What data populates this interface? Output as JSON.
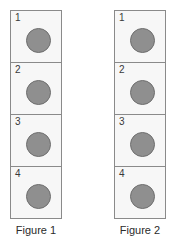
{
  "canvas": {
    "width": 171,
    "height": 242,
    "background": "#ffffff"
  },
  "style": {
    "box_fill": "#f7f7f7",
    "box_border": "#8a8a8a",
    "disc_fill": "#8f8f8f",
    "disc_outline": "#6e6e6e",
    "number_color": "#3a3a3a",
    "caption_color": "#2b2b2b"
  },
  "figures": [
    {
      "id": "figure-1",
      "caption": "Figure 1",
      "cells": [
        {
          "number": "1",
          "disc": "gray-circle"
        },
        {
          "number": "2",
          "disc": "gray-circle"
        },
        {
          "number": "3",
          "disc": "gray-circle"
        },
        {
          "number": "4",
          "disc": "gray-circle"
        }
      ]
    },
    {
      "id": "figure-2",
      "caption": "Figure 2",
      "cells": [
        {
          "number": "1",
          "disc": "gray-circle"
        },
        {
          "number": "2",
          "disc": "gray-circle"
        },
        {
          "number": "3",
          "disc": "gray-circle"
        },
        {
          "number": "4",
          "disc": "gray-circle"
        }
      ]
    }
  ]
}
